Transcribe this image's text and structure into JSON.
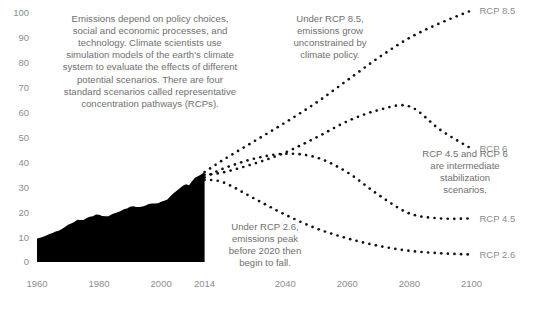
{
  "chart_data": {
    "type": "line",
    "title": "",
    "subtitle": "",
    "xlabel": "",
    "ylabel": "",
    "xlim": [
      1960,
      2105
    ],
    "ylim": [
      0,
      100
    ],
    "grid": false,
    "legend_position": "right-inline-labels",
    "y_ticks": [
      0,
      10,
      20,
      30,
      40,
      50,
      60,
      70,
      80,
      90,
      100
    ],
    "y_tick_labels": [
      "0",
      "10",
      "20",
      "30",
      "40",
      "50",
      "60",
      "70",
      "80",
      "90",
      "100"
    ],
    "x_ticks": [
      1960,
      1980,
      2000,
      2014,
      2040,
      2060,
      2080,
      2100
    ],
    "x_tick_labels": [
      "1960",
      "1980",
      "2000",
      "2014",
      "2040",
      "2060",
      "2080",
      "2100"
    ],
    "colors": {
      "historical_fill": "#000000",
      "projection_dots": "#111111",
      "tick_text": "#8d8d8d",
      "annotation_text": "#6f6f6f",
      "background": "#ffffff"
    },
    "series": [
      {
        "name": "Historical emissions",
        "style": "filled-area",
        "x": [
          1960,
          1961,
          1962,
          1963,
          1964,
          1965,
          1966,
          1967,
          1968,
          1969,
          1970,
          1971,
          1972,
          1973,
          1974,
          1975,
          1976,
          1977,
          1978,
          1979,
          1980,
          1981,
          1982,
          1983,
          1984,
          1985,
          1986,
          1987,
          1988,
          1989,
          1990,
          1991,
          1992,
          1993,
          1994,
          1995,
          1996,
          1997,
          1998,
          1999,
          2000,
          2001,
          2002,
          2003,
          2004,
          2005,
          2006,
          2007,
          2008,
          2009,
          2010,
          2011,
          2012,
          2013,
          2014
        ],
        "values": [
          9.4,
          9.7,
          10.1,
          10.6,
          11.2,
          11.6,
          12.2,
          12.6,
          13.3,
          14.1,
          15.0,
          15.5,
          16.1,
          17.0,
          16.9,
          16.9,
          17.7,
          18.2,
          18.4,
          19.1,
          19.0,
          18.5,
          18.4,
          18.4,
          19.1,
          19.6,
          20.0,
          20.5,
          21.2,
          21.5,
          22.2,
          22.4,
          22.1,
          22.1,
          22.3,
          22.7,
          23.3,
          23.5,
          23.5,
          23.6,
          24.2,
          24.6,
          25.1,
          26.4,
          27.6,
          28.6,
          29.6,
          30.6,
          31.2,
          30.8,
          32.5,
          33.9,
          34.5,
          35.2,
          36.1
        ]
      },
      {
        "name": "RCP 8.5",
        "label": "RCP 8.5",
        "style": "dotted",
        "x": [
          2014,
          2020,
          2030,
          2040,
          2050,
          2060,
          2070,
          2080,
          2090,
          2100
        ],
        "values": [
          36.1,
          41.0,
          48.5,
          56.0,
          64.0,
          73.0,
          82.0,
          90.0,
          96.0,
          101.0
        ]
      },
      {
        "name": "RCP 6",
        "label": "RCP 6",
        "style": "dotted",
        "x": [
          2014,
          2020,
          2030,
          2040,
          2050,
          2060,
          2070,
          2080,
          2090,
          2100
        ],
        "values": [
          35.0,
          36.0,
          39.5,
          44.0,
          50.0,
          56.5,
          61.0,
          62.5,
          53.0,
          45.5
        ]
      },
      {
        "name": "RCP 4.5",
        "label": "RCP 4.5",
        "style": "dotted",
        "x": [
          2014,
          2020,
          2030,
          2040,
          2050,
          2060,
          2070,
          2080,
          2090,
          2100
        ],
        "values": [
          34.0,
          37.5,
          41.5,
          43.5,
          42.0,
          36.0,
          27.0,
          19.5,
          17.5,
          17.5
        ]
      },
      {
        "name": "RCP 2.6",
        "label": "RCP 2.6",
        "style": "dotted",
        "x": [
          2014,
          2020,
          2030,
          2040,
          2050,
          2060,
          2070,
          2080,
          2090,
          2100
        ],
        "values": [
          33.0,
          32.0,
          25.5,
          19.0,
          13.5,
          9.5,
          6.5,
          4.5,
          3.5,
          3.0
        ]
      }
    ],
    "annotations": [
      {
        "id": "intro-note",
        "align": "center",
        "x_px": 150,
        "y_px": 22,
        "lines": [
          "Emissions depend on policy choices,",
          "social and economic processes, and",
          "technology. Climate scientists use",
          "simulation models of the earth's climate",
          "system to evaluate the effects of different",
          "potential scenarios. There are four",
          "standard scenarios called representative",
          "concentration pathways (RCPs)."
        ]
      },
      {
        "id": "rcp85-note",
        "align": "center",
        "x_px": 330,
        "y_px": 22,
        "lines": [
          "Under RCP 8.5,",
          "emissions grow",
          "unconstrained by",
          "climate policy."
        ]
      },
      {
        "id": "rcp26-note",
        "align": "center",
        "x_px": 265,
        "y_px": 230,
        "lines": [
          "Under RCP 2.6,",
          "emissions peak",
          "before 2020 then",
          "begin to fall."
        ]
      },
      {
        "id": "intermediate-note",
        "align": "center",
        "x_px": 465,
        "y_px": 157,
        "lines": [
          "RCP 4.5 and RCP 6",
          "are intermediate",
          "stabilization",
          "scenarios."
        ]
      }
    ]
  }
}
